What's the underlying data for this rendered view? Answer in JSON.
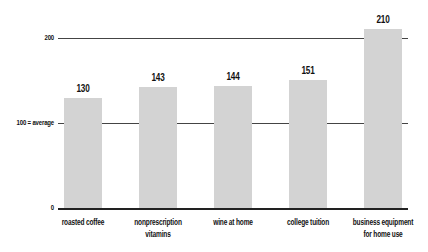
{
  "chart_data": {
    "type": "bar",
    "title": "",
    "xlabel": "",
    "ylabel": "",
    "categories": [
      "roasted coffee",
      "nonprescription vitamins",
      "wine at home",
      "college tuition",
      "business equipment for home use"
    ],
    "category_lines": [
      [
        "roasted coffee"
      ],
      [
        "nonprescription",
        "vitamins"
      ],
      [
        "wine at home"
      ],
      [
        "college tuition"
      ],
      [
        "business equipment",
        "for home use"
      ]
    ],
    "values": [
      130,
      143,
      144,
      151,
      210
    ],
    "value_labels": [
      "130",
      "143",
      "144",
      "151",
      "210"
    ],
    "ylim": [
      0,
      210
    ],
    "yticks": [
      {
        "value": 0,
        "label": "0"
      },
      {
        "value": 100,
        "label": "100 = average"
      },
      {
        "value": 200,
        "label": "200"
      }
    ],
    "grid": true,
    "reference_line": {
      "value": 100,
      "label": "100 = average"
    },
    "legend": null,
    "bar_color": "#d3d3d3"
  }
}
